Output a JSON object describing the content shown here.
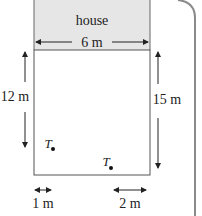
{
  "diagram": {
    "house_label": "house",
    "house_width_label": "6 m",
    "left_length_label": "12 m",
    "right_length_label": "15 m",
    "bottom_left_label": "1 m",
    "bottom_right_label": "2 m",
    "point_1_label": "T",
    "point_2_label": "T",
    "colors": {
      "house_fill": "#e6e6e6",
      "line": "#555555",
      "frame": "#888888"
    }
  }
}
